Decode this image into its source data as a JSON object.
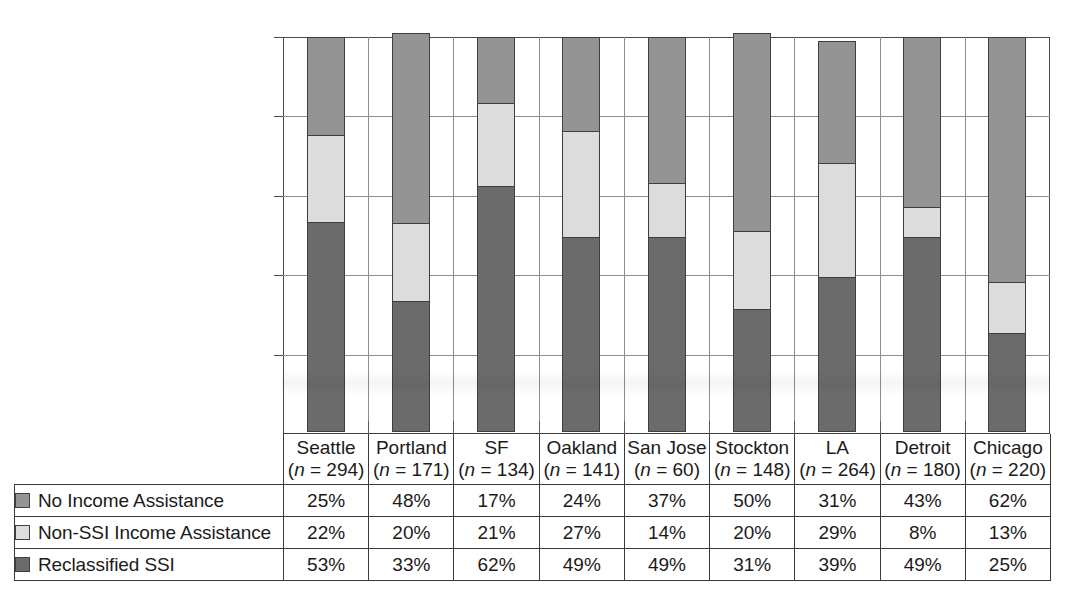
{
  "chart_data": {
    "type": "bar",
    "stacked": true,
    "stack_mode": "percent",
    "title": "",
    "subtitle": "",
    "xlabel": "",
    "ylabel": "",
    "ylim": [
      0,
      100
    ],
    "ytick_labels": [
      "0%",
      "20%",
      "40%",
      "60%",
      "80%",
      "100%"
    ],
    "ytick_values": [
      0,
      20,
      40,
      60,
      80,
      100
    ],
    "grid": true,
    "grid_axis": "y",
    "legend_position": "table-left",
    "categories": [
      "Seattle",
      "Portland",
      "SF",
      "Oakland",
      "San Jose",
      "Stockton",
      "LA",
      "Detroit",
      "Chicago"
    ],
    "category_sublabels": [
      "(n = 294)",
      "(n = 171)",
      "(n = 134)",
      "(n = 141)",
      "(n = 60)",
      "(n = 148)",
      "(n = 264)",
      "(n = 180)",
      "(n = 220)"
    ],
    "sample_sizes": [
      294,
      171,
      134,
      141,
      60,
      148,
      264,
      180,
      220
    ],
    "series": [
      {
        "name": "No Income Assistance",
        "color": "#949494",
        "values": [
          25,
          48,
          17,
          24,
          37,
          50,
          31,
          43,
          62
        ],
        "labels": [
          "25%",
          "48%",
          "17%",
          "24%",
          "37%",
          "50%",
          "31%",
          "43%",
          "62%"
        ]
      },
      {
        "name": "Non-SSI Income Assistance",
        "color": "#dcdcdc",
        "values": [
          22,
          20,
          21,
          27,
          14,
          20,
          29,
          8,
          13
        ],
        "labels": [
          "22%",
          "20%",
          "21%",
          "27%",
          "14%",
          "20%",
          "29%",
          "8%",
          "13%"
        ]
      },
      {
        "name": "Reclassified SSI",
        "color": "#6b6b6b",
        "values": [
          53,
          33,
          62,
          49,
          49,
          31,
          39,
          49,
          25
        ],
        "labels": [
          "53%",
          "33%",
          "62%",
          "49%",
          "49%",
          "31%",
          "39%",
          "49%",
          "25%"
        ]
      }
    ],
    "stack_order_bottom_to_top": [
      "Reclassified SSI",
      "Non-SSI Income Assistance",
      "No Income Assistance"
    ]
  },
  "table": {
    "header_blank_label": "",
    "columns": [
      {
        "city": "Seattle",
        "n": "(n = 294)"
      },
      {
        "city": "Portland",
        "n": "(n = 171)"
      },
      {
        "city": "SF",
        "n": "(n = 134)"
      },
      {
        "city": "Oakland",
        "n": "(n = 141)"
      },
      {
        "city": "San Jose",
        "n": "(n = 60)"
      },
      {
        "city": "Stockton",
        "n": "(n = 148)"
      },
      {
        "city": "LA",
        "n": "(n = 264)"
      },
      {
        "city": "Detroit",
        "n": "(n = 180)"
      },
      {
        "city": "Chicago",
        "n": "(n = 220)"
      }
    ],
    "rows": [
      {
        "label": "No Income Assistance",
        "swatch_color": "#949494",
        "values": [
          "25%",
          "48%",
          "17%",
          "24%",
          "37%",
          "50%",
          "31%",
          "43%",
          "62%"
        ]
      },
      {
        "label": "Non-SSI Income Assistance",
        "swatch_color": "#dcdcdc",
        "values": [
          "22%",
          "20%",
          "21%",
          "27%",
          "14%",
          "20%",
          "29%",
          "8%",
          "13%"
        ]
      },
      {
        "label": "Reclassified SSI",
        "swatch_color": "#6b6b6b",
        "values": [
          "53%",
          "33%",
          "62%",
          "49%",
          "49%",
          "31%",
          "39%",
          "49%",
          "25%"
        ]
      }
    ]
  },
  "axis": {
    "y_ticks": [
      "100%",
      "80%",
      "60%",
      "40%",
      "20%",
      "0%"
    ]
  },
  "colors": {
    "no_income_assistance": "#949494",
    "non_ssi_income_assistance": "#dcdcdc",
    "reclassified_ssi": "#6b6b6b",
    "frame": "#3a3a3a",
    "gridline": "#8d8d8d",
    "background": "#ffffff"
  }
}
